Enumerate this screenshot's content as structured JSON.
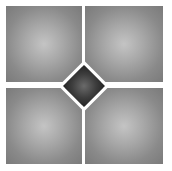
{
  "image": {
    "description": "Four gray square tiles with radial gradient separated by white grout lines, with a dark gray diamond-shaped inset at the center",
    "tiles": [
      {
        "position": "top-left"
      },
      {
        "position": "top-right"
      },
      {
        "position": "bottom-left"
      },
      {
        "position": "bottom-right"
      }
    ],
    "center_inset": {
      "shape": "diamond"
    },
    "colors": {
      "background": "#ffffff",
      "tile_light": "#c4c4c4",
      "tile_dark": "#7a7a7a",
      "diamond_light": "#6a6a6a",
      "diamond_dark": "#222222",
      "grout": "#ffffff"
    }
  }
}
